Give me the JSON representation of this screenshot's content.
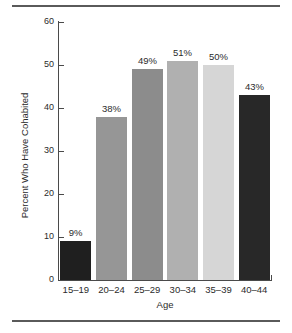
{
  "figure": {
    "background_color": "#ffffff",
    "rule_color": "#5a5a5a",
    "axis_color": "#4a4a4a",
    "text_color": "#2b2b2b"
  },
  "chart_data": {
    "type": "bar",
    "title": "",
    "subtitle": "",
    "xlabel": "Age",
    "ylabel": "Percent Who Have Cohabited",
    "categories": [
      "15–19",
      "20–24",
      "25–29",
      "30–34",
      "35–39",
      "40–44"
    ],
    "values": [
      9,
      38,
      49,
      51,
      50,
      43
    ],
    "data_labels": [
      "9%",
      "38%",
      "49%",
      "51%",
      "50%",
      "43%"
    ],
    "bar_colors": [
      "#1f1f1f",
      "#969696",
      "#8c8c8c",
      "#b0b0b0",
      "#d6d6d6",
      "#282828"
    ],
    "ylim": [
      0,
      60
    ],
    "yticks": [
      0,
      10,
      20,
      30,
      40,
      50,
      60
    ],
    "ytick_labels": [
      "0",
      "10",
      "20",
      "30",
      "40",
      "50",
      "60"
    ],
    "grid": false,
    "legend": false,
    "legend_position": "none"
  }
}
